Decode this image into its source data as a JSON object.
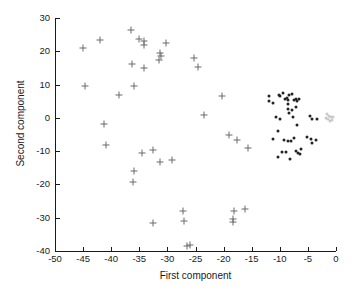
{
  "chart_data": {
    "type": "scatter",
    "title": "",
    "xlabel": "First component",
    "ylabel": "Second component",
    "xlim": [
      -50,
      0
    ],
    "ylim": [
      -40,
      30
    ],
    "xticks": [
      -50,
      -45,
      -40,
      -35,
      -30,
      -25,
      -20,
      -15,
      -10,
      -5,
      0
    ],
    "xticklabels": [
      "-50",
      "-45",
      "-40",
      "-35",
      "-30",
      "-25",
      "-20",
      "-15",
      "-10",
      "-5",
      "0"
    ],
    "yticks": [
      -40,
      -30,
      -20,
      -10,
      0,
      10,
      20,
      30
    ],
    "yticklabels": [
      "-40",
      "-30",
      "-20",
      "-10",
      "0",
      "10",
      "20",
      "30"
    ],
    "grid": false,
    "legend": null,
    "series": [
      {
        "name": "sparse-crosses",
        "marker": "plus",
        "color": "#6b6b6b",
        "points": [
          [
            -45.0,
            21.1
          ],
          [
            -44.6,
            9.7
          ],
          [
            -42.0,
            23.3
          ],
          [
            -41.2,
            -1.7
          ],
          [
            -41.0,
            -8.2
          ],
          [
            -38.7,
            7.0
          ],
          [
            -36.4,
            26.5
          ],
          [
            -36.3,
            16.2
          ],
          [
            -36.0,
            9.7
          ],
          [
            -35.9,
            -16.0
          ],
          [
            -36.2,
            -19.4
          ],
          [
            -35.0,
            23.6
          ],
          [
            -34.2,
            23.1
          ],
          [
            -34.2,
            21.8
          ],
          [
            -34.1,
            14.9
          ],
          [
            -34.6,
            -10.6
          ],
          [
            -32.5,
            -9.8
          ],
          [
            -32.6,
            -31.6
          ],
          [
            -31.5,
            17.5
          ],
          [
            -31.3,
            19.6
          ],
          [
            -31.2,
            18.6
          ],
          [
            -31.4,
            -13.3
          ],
          [
            -30.2,
            22.4
          ],
          [
            -29.1,
            -12.7
          ],
          [
            -27.2,
            -28.1
          ],
          [
            -27.1,
            -31.1
          ],
          [
            -26.5,
            -38.4
          ],
          [
            -26.0,
            -38.1
          ],
          [
            -25.2,
            18.0
          ],
          [
            -24.6,
            15.4
          ],
          [
            -23.4,
            1.0
          ],
          [
            -20.2,
            6.7
          ],
          [
            -19.0,
            -5.0
          ],
          [
            -18.3,
            -31.2
          ],
          [
            -18.3,
            -30.4
          ],
          [
            -18.1,
            -28.1
          ],
          [
            -17.6,
            -6.8
          ],
          [
            -16.2,
            -27.3
          ],
          [
            -15.6,
            -9.2
          ]
        ]
      },
      {
        "name": "dense-dots",
        "marker": "dot",
        "color": "#232323",
        "points": [
          [
            -11.9,
            6.6
          ],
          [
            -12.0,
            5.2
          ],
          [
            -11.2,
            4.6
          ],
          [
            -10.2,
            7.0
          ],
          [
            -9.9,
            6.5
          ],
          [
            -9.4,
            7.5
          ],
          [
            -9.0,
            5.6
          ],
          [
            -8.8,
            6.0
          ],
          [
            -8.6,
            5.5
          ],
          [
            -8.5,
            4.3
          ],
          [
            -8.3,
            6.9
          ],
          [
            -7.8,
            7.1
          ],
          [
            -7.5,
            5.4
          ],
          [
            -7.2,
            5.8
          ],
          [
            -6.9,
            5.2
          ],
          [
            -6.6,
            5.6
          ],
          [
            -8.6,
            2.8
          ],
          [
            -8.3,
            1.6
          ],
          [
            -7.9,
            2.4
          ],
          [
            -7.1,
            3.2
          ],
          [
            -10.6,
            0.2
          ],
          [
            -9.9,
            -0.2
          ],
          [
            -7.6,
            0.4
          ],
          [
            -6.9,
            -2.1
          ],
          [
            -4.6,
            0.6
          ],
          [
            -4.2,
            -0.2
          ],
          [
            -3.3,
            -0.4
          ],
          [
            -10.3,
            -3.9
          ],
          [
            -11.2,
            -6.3
          ],
          [
            -9.2,
            -6.8
          ],
          [
            -8.6,
            -7.0
          ],
          [
            -8.0,
            -6.9
          ],
          [
            -7.5,
            -6.1
          ],
          [
            -5.2,
            -5.8
          ],
          [
            -4.5,
            -6.4
          ],
          [
            -4.3,
            -7.6
          ],
          [
            -3.6,
            -6.7
          ],
          [
            -10.4,
            -11.7
          ],
          [
            -9.6,
            -10.4
          ],
          [
            -8.9,
            -10.3
          ],
          [
            -8.1,
            -12.3
          ],
          [
            -7.2,
            -9.9
          ],
          [
            -6.7,
            -10.6
          ],
          [
            -6.4,
            -11.0
          ],
          [
            -6.2,
            -9.4
          ]
        ]
      },
      {
        "name": "faint-cluster",
        "marker": "dot",
        "color": "#c9c9c9",
        "points": [
          [
            -1.6,
            1.1
          ],
          [
            -1.2,
            0.7
          ],
          [
            -0.9,
            0.2
          ],
          [
            -0.6,
            0.4
          ],
          [
            -1.4,
            -0.3
          ],
          [
            -1.0,
            -0.8
          ],
          [
            -0.7,
            -0.5
          ],
          [
            -1.8,
            0.0
          ]
        ]
      }
    ]
  }
}
